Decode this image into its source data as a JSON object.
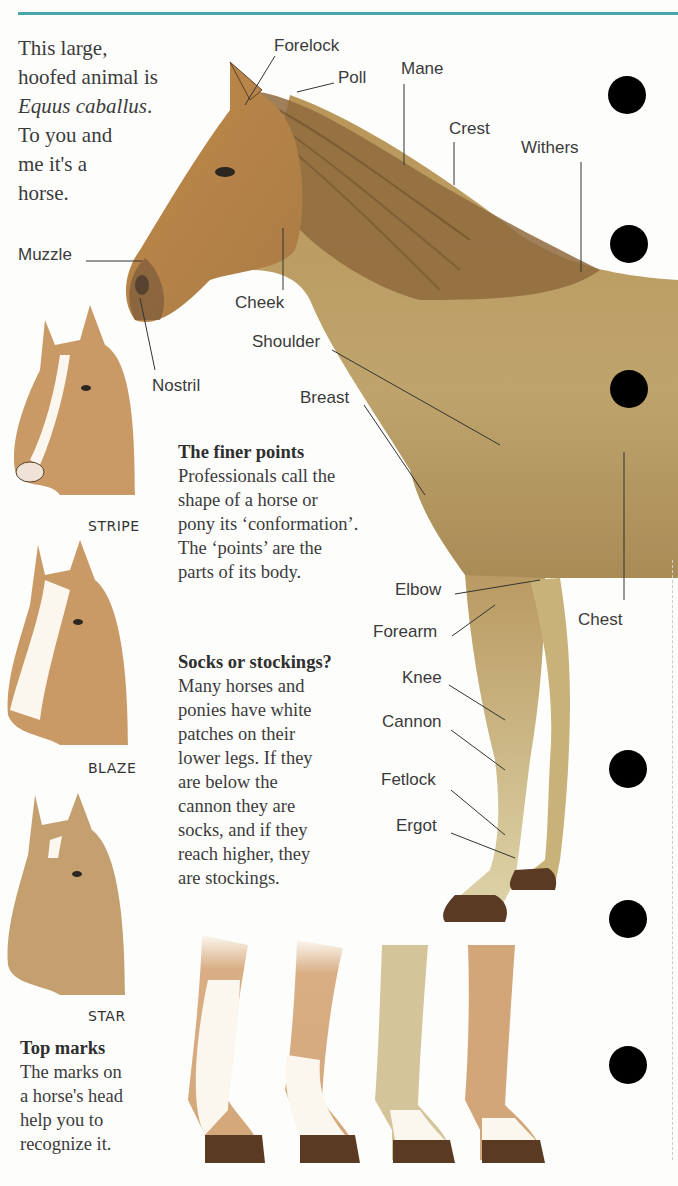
{
  "page": {
    "title_fragment": "The Horse",
    "accent_color": "#4aa7a9",
    "page_number": "8"
  },
  "intro": {
    "line1": "This large,",
    "line2": "hoofed animal is",
    "line3_italic": "Equus caballus",
    "line3_end": ".",
    "line4": "To you and",
    "line5": "me it's a",
    "line6": "horse."
  },
  "labels": {
    "forelock": "Forelock",
    "poll": "Poll",
    "mane": "Mane",
    "crest": "Crest",
    "withers": "Withers",
    "muzzle": "Muzzle",
    "cheek": "Cheek",
    "nostril": "Nostril",
    "shoulder": "Shoulder",
    "breast": "Breast",
    "elbow": "Elbow",
    "forearm": "Forearm",
    "chest": "Chest",
    "knee": "Knee",
    "cannon": "Cannon",
    "fetlock": "Fetlock",
    "ergot": "Ergot"
  },
  "head_marks": [
    {
      "name": "STRIPE"
    },
    {
      "name": "BLAZE"
    },
    {
      "name": "STAR"
    }
  ],
  "finer_points": {
    "heading": "The finer points",
    "lines": [
      "Professionals call the",
      "shape of a horse or",
      "pony its ‘conformation’.",
      "The ‘points’ are the",
      "parts of its body."
    ]
  },
  "socks": {
    "heading": "Socks or stockings?",
    "lines": [
      "Many horses and",
      "ponies have white",
      "patches on their",
      "lower legs. If they",
      "are below the",
      "cannon they are",
      "socks, and if they",
      "reach higher, they",
      "are stockings."
    ]
  },
  "top_marks": {
    "heading": "Top marks",
    "lines": [
      "The marks on",
      "a horse's head",
      "help you to",
      "recognize it."
    ]
  },
  "colors": {
    "coat": "#b98a4e",
    "coat_light": "#c9a86b",
    "body": "#b79a62",
    "mane": "#8a6a3c",
    "hoof": "#5a3a22",
    "white_marking": "#f6f3ea"
  }
}
